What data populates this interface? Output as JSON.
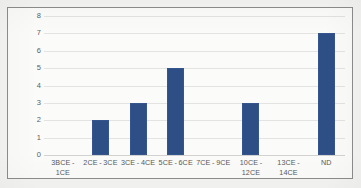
{
  "figure": {
    "background_color": "#f4f4f2",
    "frame_color": "#8d8d8d",
    "plot_background_color": "#fbfbfa"
  },
  "chart_data": {
    "type": "bar",
    "title": "",
    "subtitle": "",
    "xlabel": "",
    "ylabel": "",
    "categories": [
      "3BCE - 1CE",
      "2CE - 3CE",
      "3CE - 4CE",
      "5CE - 6CE",
      "7CE - 9CE",
      "10CE - 12CE",
      "13CE - 14CE",
      "ND"
    ],
    "values": [
      0,
      2,
      3,
      5,
      0,
      3,
      0,
      7
    ],
    "ylim": [
      0,
      8
    ],
    "ytick_labels": [
      "8",
      "7",
      "6",
      "5",
      "4",
      "3",
      "2",
      "1",
      "0"
    ],
    "ytick_values": [
      8,
      7,
      6,
      5,
      4,
      3,
      2,
      1,
      0
    ],
    "ytick_step": 1,
    "grid": true,
    "grid_axis": "y",
    "grid_color": "#e3e3e1",
    "legend": false,
    "legend_position": "none",
    "series_color": "#2e4e86",
    "bar_border_color": "#35558f",
    "annotations": []
  }
}
